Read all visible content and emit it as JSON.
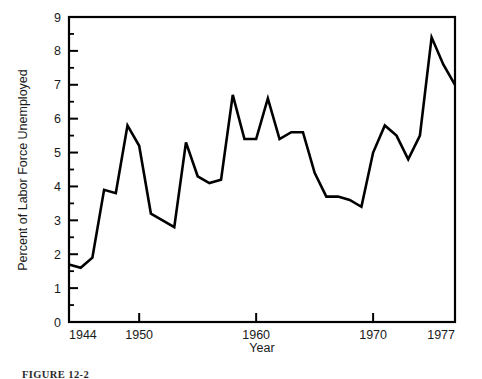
{
  "figure": {
    "caption": "FIGURE 12-2"
  },
  "chart_data": {
    "type": "line",
    "title": "",
    "xlabel": "Year",
    "ylabel": "Percent of Labor Force Unemployed",
    "xlim": [
      1944,
      1977
    ],
    "ylim": [
      0,
      9
    ],
    "grid": false,
    "legend": "none",
    "x_tick_labels": [
      "1944",
      "1950",
      "1960",
      "1970",
      "1977"
    ],
    "x_ticks": [
      1944,
      1950,
      1960,
      1970,
      1977
    ],
    "y_tick_labels": [
      "0",
      "1",
      "2",
      "3",
      "4",
      "5",
      "6",
      "7",
      "8",
      "9"
    ],
    "y_ticks": [
      0,
      1,
      2,
      3,
      4,
      5,
      6,
      7,
      8,
      9
    ],
    "y_minor_ticks": [
      0.5,
      1.5,
      2.5,
      3.5,
      4.5,
      5.5,
      6.5,
      7.5,
      8.5
    ],
    "line_color": "#000000",
    "line_width": 2.6,
    "x": [
      1944,
      1945,
      1946,
      1947,
      1948,
      1949,
      1950,
      1951,
      1952,
      1953,
      1954,
      1955,
      1956,
      1957,
      1958,
      1959,
      1960,
      1961,
      1962,
      1963,
      1964,
      1965,
      1966,
      1967,
      1968,
      1969,
      1970,
      1971,
      1972,
      1973,
      1974,
      1975,
      1976,
      1977
    ],
    "values": [
      1.7,
      1.6,
      1.9,
      3.9,
      3.8,
      5.8,
      5.2,
      3.2,
      3.0,
      2.8,
      5.3,
      4.3,
      4.1,
      4.2,
      6.7,
      5.4,
      5.4,
      6.6,
      5.4,
      5.6,
      5.6,
      4.4,
      3.7,
      3.7,
      3.6,
      3.4,
      5.0,
      5.8,
      5.5,
      4.8,
      5.5,
      8.4,
      7.6,
      7.0
    ],
    "series": [
      {
        "name": "Percent of Labor Force Unemployed",
        "values": [
          1.7,
          1.6,
          1.9,
          3.9,
          3.8,
          5.8,
          5.2,
          3.2,
          3.0,
          2.8,
          5.3,
          4.3,
          4.1,
          4.2,
          6.7,
          5.4,
          5.4,
          6.6,
          5.4,
          5.6,
          5.6,
          4.4,
          3.7,
          3.7,
          3.6,
          3.4,
          5.0,
          5.8,
          5.5,
          4.8,
          5.5,
          8.4,
          7.6,
          7.0
        ]
      }
    ]
  }
}
